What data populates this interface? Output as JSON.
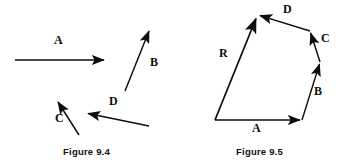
{
  "document": {
    "title": "Vector diagrams — Figure 9.4 and Figure 9.5",
    "background_color": "#ffffff",
    "ink_color": "#0d0d0d"
  },
  "figures": [
    {
      "id": "figure-9-4",
      "caption": "Figure 9.4",
      "description": "Four free vectors A, B, C and D drawn separately with arrowheads.",
      "vectors": [
        {
          "name": "A",
          "label": "A",
          "tail": [
            15,
            60
          ],
          "tip": [
            106,
            60
          ],
          "label_pos": [
            54,
            40
          ]
        },
        {
          "name": "B",
          "label": "B",
          "tail": [
            125,
            91
          ],
          "tip": [
            150,
            29
          ],
          "label_pos": [
            150,
            62
          ]
        },
        {
          "name": "C",
          "label": "C",
          "tail": [
            79,
            135
          ],
          "tip": [
            57,
            100
          ],
          "label_pos": [
            56,
            118
          ]
        },
        {
          "name": "D",
          "label": "D",
          "tail": [
            149,
            126
          ],
          "tip": [
            86,
            113
          ],
          "label_pos": [
            110,
            100
          ]
        }
      ]
    },
    {
      "id": "figure-9-5",
      "caption": "Figure 9.5",
      "description": "Head-to-tail polygon addition: vectors A, B, C and D chained, with resultant R closing the polygon from the common origin.",
      "vectors": [
        {
          "name": "A",
          "label": "A",
          "tail": [
            42,
            120
          ],
          "tip": [
            129,
            120
          ],
          "label_pos": [
            82,
            123
          ]
        },
        {
          "name": "B",
          "label": "B",
          "tail": [
            129,
            120
          ],
          "tip": [
            147,
            62
          ],
          "label_pos": [
            142,
            90
          ]
        },
        {
          "name": "C",
          "label": "C",
          "tail": [
            147,
            62
          ],
          "tip": [
            137,
            31
          ],
          "label_pos": [
            148,
            38
          ]
        },
        {
          "name": "D",
          "label": "D",
          "tail": [
            137,
            31
          ],
          "tip": [
            85,
            15
          ],
          "label_pos": [
            112,
            6
          ]
        },
        {
          "name": "R",
          "label": "R",
          "tail": [
            42,
            120
          ],
          "tip": [
            84,
            16
          ],
          "label_pos": [
            49,
            52
          ]
        }
      ]
    }
  ]
}
